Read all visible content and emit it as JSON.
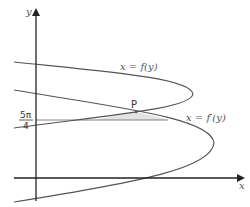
{
  "diagram": {
    "axes": {
      "x_label": "x",
      "y_label": "y"
    },
    "curves": [
      {
        "name": "f",
        "label": "x = f(y)"
      },
      {
        "name": "f-prime",
        "label": "x = f′(y)"
      }
    ],
    "point": {
      "label": "P"
    },
    "y_tick": {
      "numerator": "5π",
      "denominator": "4"
    },
    "colors": {
      "curve": "#555555",
      "axis": "#222222",
      "shade": "#e3e3e3"
    }
  }
}
